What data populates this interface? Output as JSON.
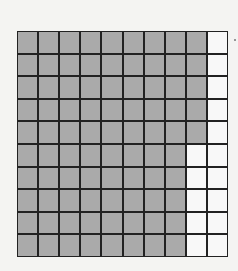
{
  "figure": {
    "type": "hundred-grid",
    "rows": 10,
    "cols": 10,
    "shaded_per_row": [
      9,
      9,
      9,
      9,
      9,
      8,
      8,
      8,
      8,
      8
    ],
    "shaded_total": 85,
    "unshaded_total": 15,
    "colors": {
      "shaded": "#aaaaaa",
      "unshaded": "#f8f8f8",
      "grid_line": "#222222",
      "background": "#f4f4f2"
    }
  }
}
